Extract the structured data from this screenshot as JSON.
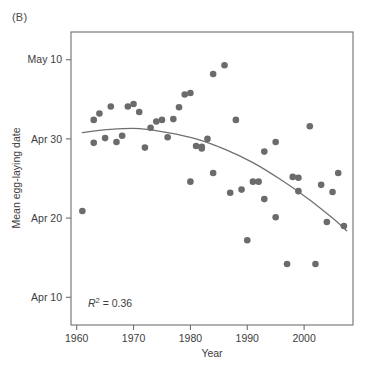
{
  "figure": {
    "panel_label": "(B)",
    "annotation": {
      "symbol": "R",
      "exponent": "2",
      "equals": " = 0.36",
      "full": "R2 = 0.36",
      "value": 0.36
    },
    "colors": {
      "point": "#6b6b6b",
      "trendline": "#6f6f6f",
      "axis": "#6f6f6f",
      "text": "#3d3d3d",
      "background": "#ffffff"
    }
  },
  "chart_data": {
    "type": "scatter",
    "title": "",
    "xlabel": "Year",
    "ylabel": "Mean egg-laying date",
    "xlim": [
      1959.0,
      2008.6
    ],
    "ylim": [
      96.5,
      133.5
    ],
    "grid": false,
    "legend": null,
    "xticks": [
      1960,
      1970,
      1980,
      1990,
      2000
    ],
    "xticklabels": [
      "1960",
      "1970",
      "1980",
      "1990",
      "2000"
    ],
    "yticks": [
      100,
      110,
      120,
      130
    ],
    "yticklabels": [
      "Apr 10",
      "Apr 20",
      "Apr 30",
      "May 10"
    ],
    "ytick_note": "y values are day-of-year: Apr 10 = 100, Apr 20 = 110, Apr 30 = 120, May 10 = 130",
    "points": [
      {
        "x": 1961,
        "y": 110.9
      },
      {
        "x": 1963,
        "y": 122.4
      },
      {
        "x": 1963,
        "y": 119.5
      },
      {
        "x": 1964,
        "y": 123.2
      },
      {
        "x": 1965,
        "y": 120.1
      },
      {
        "x": 1966,
        "y": 124.1
      },
      {
        "x": 1967,
        "y": 119.6
      },
      {
        "x": 1968,
        "y": 120.4
      },
      {
        "x": 1969,
        "y": 124.1
      },
      {
        "x": 1970,
        "y": 124.4
      },
      {
        "x": 1971,
        "y": 123.4
      },
      {
        "x": 1972,
        "y": 118.9
      },
      {
        "x": 1973,
        "y": 121.4
      },
      {
        "x": 1974,
        "y": 122.2
      },
      {
        "x": 1975,
        "y": 122.4
      },
      {
        "x": 1976,
        "y": 120.2
      },
      {
        "x": 1977,
        "y": 122.5
      },
      {
        "x": 1978,
        "y": 124.0
      },
      {
        "x": 1979,
        "y": 125.6
      },
      {
        "x": 1980,
        "y": 125.8
      },
      {
        "x": 1980,
        "y": 114.6
      },
      {
        "x": 1981,
        "y": 119.1
      },
      {
        "x": 1982,
        "y": 119.0
      },
      {
        "x": 1982,
        "y": 118.8
      },
      {
        "x": 1983,
        "y": 120.0
      },
      {
        "x": 1984,
        "y": 128.2
      },
      {
        "x": 1984,
        "y": 115.7
      },
      {
        "x": 1986,
        "y": 129.3
      },
      {
        "x": 1987,
        "y": 113.2
      },
      {
        "x": 1988,
        "y": 122.4
      },
      {
        "x": 1989,
        "y": 113.6
      },
      {
        "x": 1990,
        "y": 107.2
      },
      {
        "x": 1991,
        "y": 114.6
      },
      {
        "x": 1992,
        "y": 114.6
      },
      {
        "x": 1993,
        "y": 118.4
      },
      {
        "x": 1993,
        "y": 112.4
      },
      {
        "x": 1995,
        "y": 110.1
      },
      {
        "x": 1995,
        "y": 119.6
      },
      {
        "x": 1997,
        "y": 104.2
      },
      {
        "x": 1998,
        "y": 115.2
      },
      {
        "x": 1999,
        "y": 113.4
      },
      {
        "x": 1999,
        "y": 115.1
      },
      {
        "x": 2001,
        "y": 121.6
      },
      {
        "x": 2002,
        "y": 104.2
      },
      {
        "x": 2003,
        "y": 114.2
      },
      {
        "x": 2004,
        "y": 109.5
      },
      {
        "x": 2005,
        "y": 113.3
      },
      {
        "x": 2006,
        "y": 115.7
      },
      {
        "x": 2007,
        "y": 109.0
      }
    ],
    "trendline": {
      "kind": "quadratic-fit",
      "x_start": 1961,
      "x_end": 2007.5,
      "samples": [
        {
          "x": 1961,
          "y": 120.8
        },
        {
          "x": 1966,
          "y": 121.2
        },
        {
          "x": 1971,
          "y": 121.3
        },
        {
          "x": 1976,
          "y": 120.8
        },
        {
          "x": 1981,
          "y": 120.0
        },
        {
          "x": 1986,
          "y": 118.7
        },
        {
          "x": 1991,
          "y": 117.0
        },
        {
          "x": 1996,
          "y": 114.8
        },
        {
          "x": 2001,
          "y": 112.3
        },
        {
          "x": 2005,
          "y": 110.0
        },
        {
          "x": 2007.5,
          "y": 108.4
        }
      ]
    }
  }
}
